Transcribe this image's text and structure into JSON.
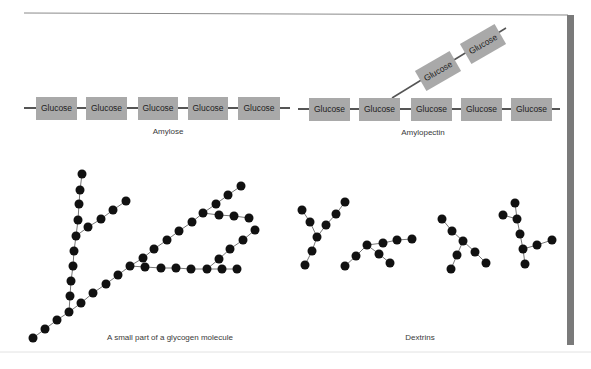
{
  "labels": {
    "amylose": "Amylose",
    "amylopectin": "Amylopectin",
    "glycogen": "A small part of a glycogen molecule",
    "dextrins": "Dextrins"
  },
  "glucose_label": "Glucose",
  "colors": {
    "box_fill": "#a9a9a9",
    "line": "#555555",
    "dot": "#111111",
    "side_bar": "#7a7a7a"
  }
}
